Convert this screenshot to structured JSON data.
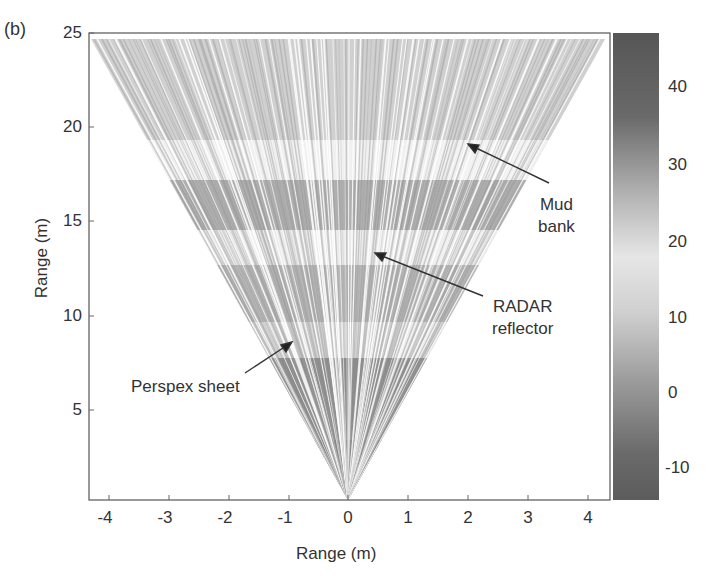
{
  "panel_label": "(b)",
  "chart_data": {
    "type": "heatmap",
    "subtype": "sector-scan sonar/radar image (fan-shaped polar plot)",
    "title": "",
    "xlabel": "Range (m)",
    "ylabel": "Range (m)",
    "xlim": [
      -4.3,
      4.3
    ],
    "ylim": [
      0,
      25
    ],
    "xticks": [
      "-4",
      "-3",
      "-2",
      "-1",
      "0",
      "1",
      "2",
      "3",
      "4"
    ],
    "yticks": [
      "5",
      "10",
      "15",
      "20",
      "25"
    ],
    "grid": false,
    "fan": {
      "apex": [
        0,
        0
      ],
      "left_edge_top": [
        -4.25,
        24.6
      ],
      "right_edge_top": [
        4.25,
        24.6
      ],
      "bright_bands_range_m": [
        [
          8,
          9.5
        ],
        [
          12.5,
          14.5
        ],
        [
          18.5,
          21
        ]
      ],
      "dark_bands_range_m": [
        [
          0,
          7.5
        ],
        [
          15,
          17
        ]
      ]
    },
    "colorbar": {
      "ticks": [
        "40",
        "30",
        "20",
        "10",
        "0",
        "-10"
      ],
      "range": [
        -15,
        48
      ],
      "colors": {
        "high": "#555555",
        "mid": "#e8e8e8",
        "low": "#5a5a5a"
      }
    },
    "annotations": [
      {
        "text": "Mud bank",
        "lines": [
          "Mud",
          "bank"
        ],
        "arrow_to": [
          2.0,
          19.0
        ]
      },
      {
        "text": "RADAR reflector",
        "lines": [
          "RADAR",
          "reflector"
        ],
        "arrow_to": [
          0.45,
          13.4
        ]
      },
      {
        "text": "Perspex sheet",
        "lines": [
          "Perspex sheet"
        ],
        "arrow_to": [
          -0.9,
          8.7
        ]
      }
    ]
  }
}
